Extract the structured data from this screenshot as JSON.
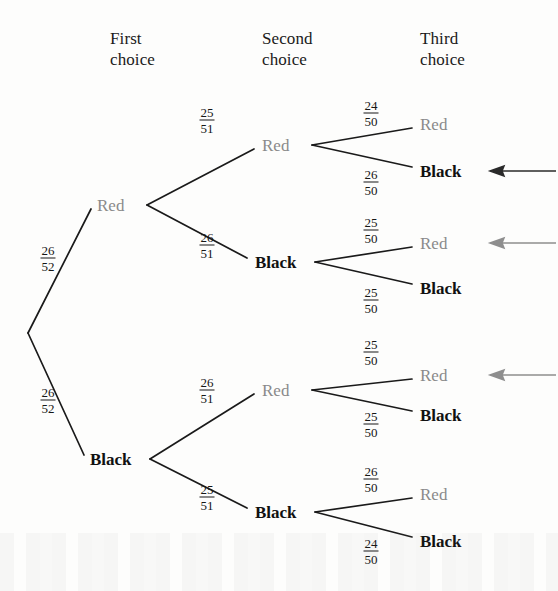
{
  "headers": [
    {
      "id": "first",
      "label": "First\nchoice",
      "x": 110,
      "y": 28
    },
    {
      "id": "second",
      "label": "Second\nchoice",
      "x": 262,
      "y": 28
    },
    {
      "id": "third",
      "label": "Third\nchoice",
      "x": 420,
      "y": 28
    }
  ],
  "colors": {
    "red_label": "#8a8a8a",
    "black_label": "#111111",
    "edge": "#1a1a1a",
    "arrow_black": "#2a2a2a",
    "arrow_gray": "#8e8e8e",
    "background": "#fdfdfc"
  },
  "root": {
    "x": 28,
    "y": 333
  },
  "level1": [
    {
      "id": "l1-red",
      "label": "Red",
      "kind": "red",
      "x": 97,
      "y": 205,
      "vertex_x": 147,
      "frac": {
        "num": "26",
        "den": "52",
        "x": 48,
        "y": 258
      }
    },
    {
      "id": "l1-black",
      "label": "Black",
      "kind": "black",
      "x": 90,
      "y": 459,
      "vertex_x": 150,
      "frac": {
        "num": "26",
        "den": "52",
        "x": 48,
        "y": 400
      }
    }
  ],
  "level2": [
    {
      "id": "l2-red-red",
      "parent": "l1-red",
      "label": "Red",
      "kind": "red",
      "x": 262,
      "y": 145,
      "vertex_x": 312,
      "frac": {
        "num": "25",
        "den": "51",
        "x": 207,
        "y": 120
      }
    },
    {
      "id": "l2-red-black",
      "parent": "l1-red",
      "label": "Black",
      "kind": "black",
      "x": 255,
      "y": 262,
      "vertex_x": 315,
      "frac": {
        "num": "26",
        "den": "51",
        "x": 207,
        "y": 245
      }
    },
    {
      "id": "l2-black-red",
      "parent": "l1-black",
      "label": "Red",
      "kind": "red",
      "x": 262,
      "y": 390,
      "vertex_x": 312,
      "frac": {
        "num": "26",
        "den": "51",
        "x": 207,
        "y": 390
      }
    },
    {
      "id": "l2-black-black",
      "parent": "l1-black",
      "label": "Black",
      "kind": "black",
      "x": 255,
      "y": 512,
      "vertex_x": 315,
      "frac": {
        "num": "25",
        "den": "51",
        "x": 207,
        "y": 497
      }
    }
  ],
  "level3": [
    {
      "id": "l3-rrr",
      "parent": "l2-red-red",
      "label": "Red",
      "kind": "red",
      "x": 420,
      "y": 124,
      "frac": {
        "num": "24",
        "den": "50",
        "x": 371,
        "y": 113
      },
      "arrow": null
    },
    {
      "id": "l3-rrb",
      "parent": "l2-red-red",
      "label": "Black",
      "kind": "black",
      "x": 420,
      "y": 171,
      "frac": {
        "num": "26",
        "den": "50",
        "x": 371,
        "y": 182
      },
      "arrow": "black"
    },
    {
      "id": "l3-rbr",
      "parent": "l2-red-black",
      "label": "Red",
      "kind": "red",
      "x": 420,
      "y": 243,
      "frac": {
        "num": "25",
        "den": "50",
        "x": 371,
        "y": 230
      },
      "arrow": "gray"
    },
    {
      "id": "l3-rbb",
      "parent": "l2-red-black",
      "label": "Black",
      "kind": "black",
      "x": 420,
      "y": 288,
      "frac": {
        "num": "25",
        "den": "50",
        "x": 371,
        "y": 300
      },
      "arrow": null
    },
    {
      "id": "l3-brr",
      "parent": "l2-black-red",
      "label": "Red",
      "kind": "red",
      "x": 420,
      "y": 375,
      "frac": {
        "num": "25",
        "den": "50",
        "x": 371,
        "y": 352
      },
      "arrow": "gray"
    },
    {
      "id": "l3-brb",
      "parent": "l2-black-red",
      "label": "Black",
      "kind": "black",
      "x": 420,
      "y": 415,
      "frac": {
        "num": "25",
        "den": "50",
        "x": 371,
        "y": 424
      },
      "arrow": null
    },
    {
      "id": "l3-bbr",
      "parent": "l2-black-black",
      "label": "Red",
      "kind": "red",
      "x": 420,
      "y": 494,
      "frac": {
        "num": "26",
        "den": "50",
        "x": 371,
        "y": 479
      },
      "arrow": null
    },
    {
      "id": "l3-bbb",
      "parent": "l2-black-black",
      "label": "Black",
      "kind": "black",
      "x": 420,
      "y": 541,
      "frac": {
        "num": "24",
        "den": "50",
        "x": 371,
        "y": 551
      },
      "arrow": null
    }
  ],
  "arrows": [
    {
      "id": "arrow-1",
      "kind": "black",
      "tip_x": 490,
      "tail_x": 556,
      "y": 171
    },
    {
      "id": "arrow-2",
      "kind": "gray",
      "tip_x": 490,
      "tail_x": 556,
      "y": 243
    },
    {
      "id": "arrow-3",
      "kind": "gray",
      "tip_x": 490,
      "tail_x": 556,
      "y": 375
    }
  ]
}
